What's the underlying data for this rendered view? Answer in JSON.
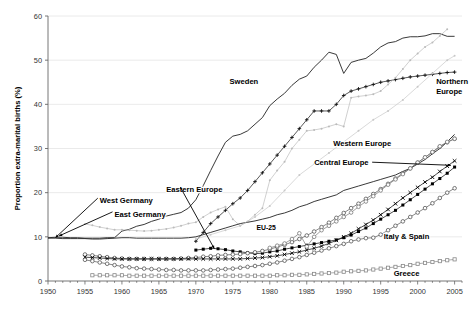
{
  "chart_data": {
    "type": "line",
    "title": "",
    "xlabel": "",
    "ylabel": "Proportion extra-marital births (%)",
    "xlim": [
      1950,
      2006
    ],
    "ylim": [
      0,
      60
    ],
    "xticks": [
      1950,
      1955,
      1960,
      1965,
      1970,
      1975,
      1980,
      1985,
      1990,
      1995,
      2000,
      2005
    ],
    "yticks": [
      0,
      10,
      20,
      30,
      40,
      50,
      60
    ],
    "grid": "horizontal",
    "legend_position": "inline-annotations",
    "series": [
      {
        "name": "Sweden",
        "marker": "none",
        "color": "#222222",
        "label_x": 1977,
        "label_y": 45.5,
        "x": [
          1950,
          1951,
          1952,
          1953,
          1954,
          1955,
          1956,
          1957,
          1958,
          1959,
          1960,
          1961,
          1962,
          1963,
          1964,
          1965,
          1966,
          1967,
          1968,
          1969,
          1970,
          1971,
          1972,
          1973,
          1974,
          1975,
          1976,
          1977,
          1978,
          1979,
          1980,
          1981,
          1982,
          1983,
          1984,
          1985,
          1986,
          1987,
          1988,
          1989,
          1990,
          1991,
          1992,
          1993,
          1994,
          1995,
          1996,
          1997,
          1998,
          1999,
          2000,
          2001,
          2002,
          2003,
          2004,
          2005
        ],
        "values": [
          9.8,
          9.9,
          9.9,
          9.8,
          9.8,
          9.7,
          9.7,
          9.7,
          9.8,
          9.8,
          11.3,
          11.7,
          12.4,
          12.8,
          13.5,
          14.0,
          14.7,
          15.1,
          15.5,
          16.5,
          18.4,
          21.6,
          25.0,
          28.3,
          31.4,
          32.8,
          33.2,
          34.0,
          35.5,
          37.0,
          39.7,
          41.2,
          42.5,
          44.3,
          45.7,
          46.4,
          48.4,
          50.0,
          51.8,
          51.3,
          47.0,
          49.5,
          50.0,
          50.4,
          51.6,
          53.0,
          53.9,
          54.2,
          55.0,
          55.3,
          55.3,
          55.5,
          56.0,
          56.0,
          55.4,
          55.4
        ]
      },
      {
        "name": "Northern Europe",
        "marker": "plus",
        "color": "#111111",
        "label_x": 2003,
        "label_y": 45.0,
        "x": [
          1970,
          1971,
          1972,
          1973,
          1974,
          1975,
          1976,
          1977,
          1978,
          1979,
          1980,
          1981,
          1982,
          1983,
          1984,
          1985,
          1986,
          1987,
          1988,
          1989,
          1990,
          1991,
          1992,
          1993,
          1994,
          1995,
          1996,
          1997,
          1998,
          1999,
          2000,
          2001,
          2002,
          2003,
          2004,
          2005
        ],
        "values": [
          9.0,
          11.0,
          13.0,
          14.5,
          16.0,
          17.5,
          18.8,
          20.5,
          22.5,
          24.5,
          26.5,
          28.5,
          30.5,
          32.5,
          34.5,
          36.5,
          38.5,
          38.5,
          38.5,
          40.0,
          42.0,
          43.0,
          43.5,
          44.0,
          44.5,
          45.0,
          45.3,
          45.6,
          45.9,
          46.2,
          46.4,
          46.6,
          46.8,
          47.0,
          47.2,
          47.3
        ]
      },
      {
        "name": "East Germany",
        "marker": "dot",
        "color": "#bbbbbb",
        "label_x": 1958,
        "label_y": 15.4,
        "x": [
          1955,
          1956,
          1957,
          1958,
          1959,
          1960,
          1961,
          1962,
          1963,
          1964,
          1965,
          1966,
          1967,
          1968,
          1969,
          1970,
          1971,
          1972,
          1973,
          1974,
          1975,
          1976,
          1977,
          1978,
          1979,
          1980,
          1981,
          1982,
          1983,
          1984,
          1985,
          1986,
          1987,
          1988,
          1989,
          1990,
          1991,
          1992,
          1993,
          1994,
          1995,
          1996,
          1997,
          1998,
          1999,
          2000,
          2001,
          2002,
          2003,
          2004
        ],
        "values": [
          12.9,
          12.6,
          12.2,
          11.9,
          11.6,
          11.6,
          11.5,
          11.4,
          11.3,
          11.4,
          11.6,
          11.8,
          12.1,
          12.5,
          13.0,
          13.3,
          14.5,
          15.5,
          16.2,
          16.8,
          14.0,
          12.5,
          13.5,
          15.0,
          16.5,
          22.8,
          25.0,
          27.0,
          30.0,
          32.0,
          34.0,
          34.2,
          34.5,
          35.0,
          35.5,
          35.0,
          41.5,
          41.8,
          42.0,
          42.3,
          43.0,
          44.5,
          46.0,
          48.0,
          50.0,
          51.5,
          53.0,
          54.0,
          55.5,
          57.0
        ]
      },
      {
        "name": "West Germany",
        "marker": "none",
        "color": "#222222",
        "label_x": 1957,
        "label_y": 18.3,
        "x": [
          1950,
          1951,
          1952,
          1953,
          1954,
          1955,
          1956,
          1957,
          1958,
          1959,
          1960,
          1961,
          1962,
          1963,
          1964,
          1965,
          1966,
          1967,
          1968,
          1969,
          1970,
          1971,
          1972,
          1973,
          1974,
          1975,
          1976,
          1977,
          1978,
          1979,
          1980,
          1981,
          1982,
          1983,
          1984,
          1985,
          1986,
          1987,
          1988,
          1989,
          1990,
          1991,
          1992,
          1993,
          1994,
          1995,
          1996,
          1997,
          1998,
          1999,
          2000,
          2001,
          2002,
          2003,
          2004,
          2005
        ],
        "values": [
          9.7,
          9.7,
          9.6,
          9.6,
          9.6,
          9.6,
          9.5,
          9.5,
          9.6,
          9.7,
          9.8,
          9.8,
          9.7,
          9.7,
          9.7,
          9.7,
          9.7,
          9.7,
          9.7,
          9.8,
          10.0,
          10.5,
          11.0,
          11.5,
          12.0,
          12.5,
          13.0,
          13.3,
          13.6,
          14.0,
          14.4,
          15.0,
          15.4,
          16.0,
          16.8,
          17.3,
          18.0,
          18.5,
          19.0,
          19.5,
          20.5,
          21.0,
          21.5,
          22.0,
          22.5,
          23.0,
          23.5,
          24.0,
          24.8,
          25.5,
          26.5,
          27.5,
          28.8,
          30.0,
          31.5,
          33.2
        ]
      },
      {
        "name": "Eastern Europe",
        "marker": "square-filled",
        "color": "#000000",
        "label_x": 1969,
        "label_y": 21.0,
        "x": [
          1970,
          1971,
          1972,
          1973,
          1974,
          1975,
          1976,
          1977,
          1978,
          1979,
          1980,
          1981,
          1982,
          1983,
          1984,
          1985,
          1986,
          1987,
          1988,
          1989,
          1990,
          1991,
          1992,
          1993,
          1994,
          1995,
          1996,
          1997,
          1998,
          1999,
          2000,
          2001,
          2002,
          2003,
          2004,
          2005
        ],
        "values": [
          7.0,
          7.2,
          7.4,
          7.3,
          7.1,
          6.8,
          6.6,
          6.4,
          6.2,
          6.3,
          6.6,
          6.8,
          7.2,
          7.5,
          7.8,
          8.1,
          8.4,
          8.7,
          9.0,
          9.3,
          9.8,
          10.4,
          11.2,
          12.0,
          13.0,
          14.0,
          15.0,
          16.0,
          17.2,
          18.4,
          19.6,
          20.8,
          22.0,
          23.2,
          24.4,
          25.8
        ]
      },
      {
        "name": "Western Europe",
        "marker": "circle-open",
        "color": "#555555",
        "label_x": 1993,
        "label_y": 31.2,
        "x": [
          1955,
          1956,
          1957,
          1958,
          1959,
          1960,
          1961,
          1962,
          1963,
          1964,
          1965,
          1966,
          1967,
          1968,
          1969,
          1970,
          1971,
          1972,
          1973,
          1974,
          1975,
          1976,
          1977,
          1978,
          1979,
          1980,
          1981,
          1982,
          1983,
          1984,
          1985,
          1986,
          1987,
          1988,
          1989,
          1990,
          1991,
          1992,
          1993,
          1994,
          1995,
          1996,
          1997,
          1998,
          1999,
          2000,
          2001,
          2002,
          2003,
          2004,
          2005
        ],
        "values": [
          6.0,
          5.8,
          5.6,
          5.4,
          5.2,
          5.1,
          5.0,
          5.0,
          5.0,
          5.0,
          5.0,
          5.0,
          5.0,
          5.1,
          5.2,
          5.3,
          5.5,
          5.6,
          5.8,
          5.9,
          6.0,
          6.1,
          6.3,
          6.5,
          6.8,
          7.2,
          7.7,
          8.2,
          8.8,
          9.5,
          10.3,
          11.2,
          12.2,
          13.2,
          14.3,
          15.4,
          16.5,
          17.5,
          18.6,
          19.7,
          20.8,
          22.0,
          23.2,
          24.4,
          25.5,
          26.8,
          28.0,
          29.2,
          30.4,
          31.4,
          32.2
        ]
      },
      {
        "name": "EU-25",
        "marker": "circle-open",
        "color": "#777777",
        "label_x": 1980,
        "label_y": 12.0,
        "x": [
          1980,
          1981,
          1982,
          1983,
          1984,
          1985,
          1986,
          1987,
          1988,
          1989,
          1990,
          1991,
          1992,
          1993,
          1994,
          1995,
          1996,
          1997,
          1998,
          1999,
          2000,
          2001,
          2002,
          2003,
          2004,
          2005
        ],
        "values": [
          7.5,
          8.0,
          8.5,
          9.5,
          10.8,
          7.8,
          10.0,
          11.5,
          12.5,
          13.5,
          14.5,
          15.5,
          16.8,
          18.0,
          19.2,
          20.5,
          21.8,
          23.0,
          24.2,
          25.5,
          26.8,
          28.0,
          29.2,
          30.5,
          31.5,
          32.2
        ]
      },
      {
        "name": "Central Europe",
        "marker": "x-cross",
        "color": "#000000",
        "label_x": 1988,
        "label_y": 27.0,
        "x": [
          1955,
          1956,
          1957,
          1958,
          1959,
          1960,
          1961,
          1962,
          1963,
          1964,
          1965,
          1966,
          1967,
          1968,
          1969,
          1970,
          1971,
          1972,
          1973,
          1974,
          1975,
          1976,
          1977,
          1978,
          1979,
          1980,
          1981,
          1982,
          1983,
          1984,
          1985,
          1986,
          1987,
          1988,
          1989,
          1990,
          1991,
          1992,
          1993,
          1994,
          1995,
          1996,
          1997,
          1998,
          1999,
          2000,
          2001,
          2002,
          2003,
          2004,
          2005
        ],
        "values": [
          5.4,
          5.3,
          5.2,
          5.1,
          5.0,
          5.0,
          5.0,
          5.0,
          5.0,
          5.0,
          5.0,
          5.0,
          5.0,
          5.0,
          5.0,
          5.0,
          5.0,
          5.0,
          5.0,
          5.0,
          5.0,
          5.0,
          5.1,
          5.2,
          5.3,
          5.5,
          5.7,
          6.0,
          6.3,
          6.6,
          7.0,
          7.4,
          7.9,
          8.5,
          9.2,
          10.0,
          10.8,
          11.8,
          12.8,
          13.8,
          15.0,
          16.2,
          17.5,
          18.8,
          20.0,
          21.2,
          22.4,
          23.5,
          24.8,
          26.0,
          27.2
        ]
      },
      {
        "name": "Italy & Spain",
        "marker": "circle-open",
        "color": "#555555",
        "label_x": 1999,
        "label_y": 10.0,
        "x": [
          1955,
          1956,
          1957,
          1958,
          1959,
          1960,
          1961,
          1962,
          1963,
          1964,
          1965,
          1966,
          1967,
          1968,
          1969,
          1970,
          1971,
          1972,
          1973,
          1974,
          1975,
          1976,
          1977,
          1978,
          1979,
          1980,
          1981,
          1982,
          1983,
          1984,
          1985,
          1986,
          1987,
          1988,
          1989,
          1990,
          1991,
          1992,
          1993,
          1994,
          1995,
          1996,
          1997,
          1998,
          1999,
          2000,
          2001,
          2002,
          2003,
          2004,
          2005
        ],
        "values": [
          4.8,
          4.5,
          4.2,
          3.9,
          3.6,
          3.3,
          3.1,
          2.9,
          2.8,
          2.7,
          2.6,
          2.5,
          2.5,
          2.4,
          2.4,
          2.4,
          2.4,
          2.5,
          2.6,
          2.7,
          2.8,
          3.0,
          3.2,
          3.4,
          3.6,
          3.9,
          4.2,
          4.6,
          5.0,
          5.4,
          5.9,
          6.4,
          6.9,
          7.4,
          7.9,
          8.4,
          9.0,
          9.4,
          9.7,
          9.8,
          10.5,
          11.5,
          12.5,
          13.5,
          14.5,
          15.5,
          16.5,
          17.6,
          18.8,
          20.0,
          21.0
        ]
      },
      {
        "name": "Greece",
        "marker": "square-open",
        "color": "#888888",
        "label_x": 1999,
        "label_y": 1.6,
        "x": [
          1956,
          1957,
          1958,
          1959,
          1960,
          1961,
          1962,
          1963,
          1964,
          1965,
          1966,
          1967,
          1968,
          1969,
          1970,
          1971,
          1972,
          1973,
          1974,
          1975,
          1976,
          1977,
          1978,
          1979,
          1980,
          1981,
          1982,
          1983,
          1984,
          1985,
          1986,
          1987,
          1988,
          1989,
          1990,
          1991,
          1992,
          1993,
          1994,
          1995,
          1996,
          1997,
          1998,
          1999,
          2000,
          2001,
          2002,
          2003,
          2004,
          2005
        ],
        "values": [
          1.3,
          1.3,
          1.3,
          1.3,
          1.3,
          1.2,
          1.2,
          1.2,
          1.2,
          1.2,
          1.2,
          1.2,
          1.2,
          1.2,
          1.2,
          1.2,
          1.2,
          1.2,
          1.2,
          1.2,
          1.2,
          1.2,
          1.2,
          1.2,
          1.2,
          1.3,
          1.3,
          1.4,
          1.4,
          1.5,
          1.6,
          1.7,
          1.8,
          1.9,
          2.1,
          2.2,
          2.3,
          2.4,
          2.6,
          2.8,
          3.0,
          3.2,
          3.4,
          3.6,
          3.9,
          4.1,
          4.3,
          4.5,
          4.7,
          4.9
        ]
      },
      {
        "name": "Other grey upper",
        "marker": "dot",
        "color": "#c8c8c8",
        "label_x": null,
        "label_y": null,
        "x": [
          1970,
          1972,
          1974,
          1976,
          1978,
          1980,
          1982,
          1984,
          1986,
          1988,
          1990,
          1992,
          1994,
          1996,
          1998,
          2000,
          2002,
          2004,
          2005
        ],
        "values": [
          9.5,
          10.5,
          11.5,
          12.5,
          14.5,
          17.0,
          20.5,
          24.0,
          26.5,
          29.0,
          31.5,
          34.0,
          36.5,
          38.5,
          41.0,
          44.0,
          47.0,
          50.0,
          51.0
        ]
      }
    ],
    "annotations": [
      {
        "text": "West Germany",
        "x": 1957,
        "y": 18.3,
        "leader_to_x": 1951,
        "leader_to_y": 9.8
      },
      {
        "text": "East Germany",
        "x": 1959,
        "y": 15.2,
        "leader_to_x": 1951.5,
        "leader_to_y": 10.2
      },
      {
        "text": "Eastern Europe",
        "x": 1966,
        "y": 20.8,
        "leader_to_x": 1972.5,
        "leader_to_y": 7.3
      },
      {
        "text": "Central Europe",
        "x": 1986,
        "y": 26.9,
        "leader_to_x": 2004.5,
        "leader_to_y": 26.2
      },
      {
        "text": "Sweden",
        "x": 1976.5,
        "y": 45.3,
        "leader_to_x": null,
        "leader_to_y": null
      },
      {
        "text": "Northern Europe",
        "x": 2002.5,
        "y": 45.2,
        "leader_to_x": null,
        "leader_to_y": null
      },
      {
        "text": "Western Europe",
        "x": 1992.5,
        "y": 31.3,
        "leader_to_x": null,
        "leader_to_y": null
      },
      {
        "text": "EU-25",
        "x": 1979.5,
        "y": 12.2,
        "leader_to_x": null,
        "leader_to_y": null
      },
      {
        "text": "Italy & Spain",
        "x": 1998.5,
        "y": 10.1,
        "leader_to_x": null,
        "leader_to_y": null
      },
      {
        "text": "Greece",
        "x": 1998.5,
        "y": 1.7,
        "leader_to_x": null,
        "leader_to_y": null
      }
    ]
  },
  "axis": {
    "y_title": "Proportion extra-marital births (%)"
  }
}
